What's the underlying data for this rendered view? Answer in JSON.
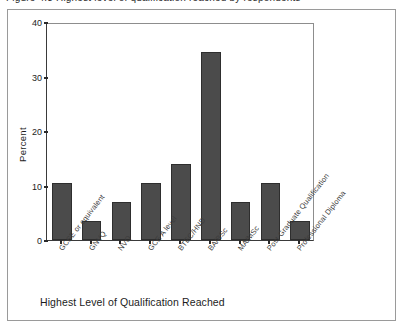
{
  "figure": {
    "top_caption": "Figure 4.3 Highest level of qualification reached by respondents",
    "x_axis_title": "Highest Level of Qualification Reached",
    "y_axis_title": "Percent"
  },
  "chart_data": {
    "type": "bar",
    "title": "",
    "xlabel": "Highest Level of Qualification Reached",
    "ylabel": "Percent",
    "ylim": [
      0,
      40
    ],
    "yticks": [
      0,
      10,
      20,
      30,
      40
    ],
    "grid": false,
    "legend": null,
    "bar_color": "#4b4b4b",
    "categories": [
      "GCSE or equivalent",
      "GNVQ",
      "NVQ",
      "GCE A level",
      "BTEC/HND",
      "BA/BSc",
      "MA/MSc",
      "Post Graduate Qualification",
      "Professional Diploma"
    ],
    "values": [
      10.5,
      3.5,
      7,
      10.5,
      14,
      34.5,
      7,
      10.5,
      3.5
    ]
  }
}
